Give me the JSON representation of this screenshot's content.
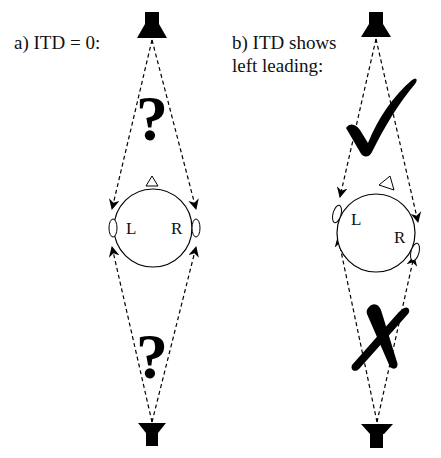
{
  "panels": [
    {
      "id": "a",
      "title": "a) ITD = 0:",
      "head_labels": {
        "left": "L",
        "right": "R"
      },
      "top_marker": "?",
      "bottom_marker": "?",
      "top_marker_icon": "question-mark",
      "bottom_marker_icon": "question-mark"
    },
    {
      "id": "b",
      "title_line1": "b) ITD shows",
      "title_line2": "left leading:",
      "head_labels": {
        "left": "L",
        "right": "R"
      },
      "top_marker_icon": "checkmark",
      "bottom_marker_icon": "cross"
    }
  ],
  "colors": {
    "ink": "#000000",
    "background": "#ffffff"
  }
}
